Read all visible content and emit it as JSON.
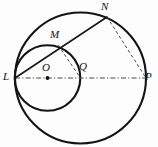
{
  "figure": {
    "kind": "plane-geometry-diagram",
    "colors": {
      "stroke": "#141414",
      "dash": "#4a4a4a",
      "background": "#fdfdfd",
      "label": "#111111"
    },
    "canvas": {
      "width": 158,
      "height": 147
    },
    "circles": [
      {
        "id": "large-circle",
        "name": "big-circle",
        "cx": 80.5,
        "cy": 78,
        "r": 65.5,
        "stroke_width": 2.1,
        "style": "solid"
      },
      {
        "id": "small-circle",
        "name": "small-circle",
        "cx": 47.5,
        "cy": 78,
        "r": 32.8,
        "stroke_width": 2.1,
        "style": "solid"
      }
    ],
    "points": [
      {
        "id": "L",
        "label": "L",
        "x": 15,
        "y": 78,
        "label_x": 3,
        "label_y": 71,
        "role": "tangency-point-left"
      },
      {
        "id": "O",
        "label": "O",
        "x": 47.5,
        "y": 78,
        "label_x": 42,
        "label_y": 62,
        "role": "small-circle-center",
        "dot": true
      },
      {
        "id": "Q",
        "label": "Q",
        "x": 80.5,
        "y": 78,
        "label_x": 79,
        "label_y": 61,
        "role": "large-circle-center"
      },
      {
        "id": "P",
        "label": "P",
        "x": 146,
        "y": 78,
        "label_x": 145,
        "label_y": 71,
        "role": "diameter-right-end"
      },
      {
        "id": "M",
        "label": "M",
        "x": 58,
        "y": 45,
        "label_x": 50,
        "label_y": 29,
        "role": "chord-meets-small-circle"
      },
      {
        "id": "N",
        "label": "N",
        "x": 107,
        "y": 17,
        "label_x": 101,
        "label_y": 1,
        "role": "chord-end-on-large-circle"
      }
    ],
    "solid_segments": [
      {
        "id": "LN",
        "name": "segment-L-N",
        "from": "L",
        "to": "N",
        "stroke_width": 1.5
      }
    ],
    "dashed_segments": [
      {
        "id": "LP",
        "name": "segment-L-P-diameter",
        "from": "L",
        "to": "P",
        "pattern": "dash-dot",
        "stroke_width": 1.2
      },
      {
        "id": "MQ",
        "name": "segment-M-Q",
        "from": "M",
        "to": "Q",
        "pattern": "dash",
        "stroke_width": 1.0
      },
      {
        "id": "NP",
        "name": "segment-N-P",
        "from": "N",
        "to": "P",
        "pattern": "dash",
        "stroke_width": 1.0
      }
    ],
    "labels": {
      "L": "L",
      "O": "O",
      "Q": "Q",
      "P": "P",
      "M": "M",
      "N": "N"
    },
    "label_font_size_px": 11
  }
}
